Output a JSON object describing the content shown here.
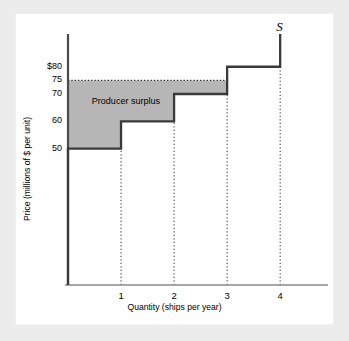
{
  "figure": {
    "background": "#ececec",
    "panel_background": "#ffffff",
    "curve_color": "#3a3a3a",
    "shade_color": "#b6b6b6",
    "axis_color": "#555555"
  },
  "chart_data": {
    "type": "area",
    "title": "",
    "xlabel": "Quantity (ships per year)",
    "ylabel": "Price (millions of $ per unit)",
    "xlim": [
      0,
      4.6
    ],
    "ylim": [
      0,
      92
    ],
    "grid": false,
    "legend": "none",
    "x_ticks": [
      "1",
      "2",
      "3",
      "4"
    ],
    "x_tick_values": [
      1,
      2,
      3,
      4
    ],
    "y_ticks": [
      "$80",
      "75",
      "70",
      "60",
      "50"
    ],
    "y_tick_values": [
      80,
      75,
      70,
      60,
      50
    ],
    "series": [
      {
        "name": "S",
        "type": "step",
        "label": "S",
        "steps": [
          {
            "q_start": 0,
            "q_end": 1,
            "price": 50
          },
          {
            "q_start": 1,
            "q_end": 2,
            "price": 60
          },
          {
            "q_start": 2,
            "q_end": 3,
            "price": 70
          },
          {
            "q_start": 3,
            "q_end": 4,
            "price": 80
          }
        ],
        "vertical_at_q": 4,
        "vertical_top_price": 92
      }
    ],
    "market_price": 75,
    "market_price_line": {
      "value": 75,
      "style": "dotted",
      "from_q": 0,
      "to_q": 3
    },
    "dropline_q_values": [
      1,
      2,
      3,
      4
    ],
    "shaded_region": {
      "label": "Producer surplus",
      "top_price": 75,
      "segments": [
        {
          "q_start": 0,
          "q_end": 1,
          "bottom_price": 50
        },
        {
          "q_start": 1,
          "q_end": 2,
          "bottom_price": 60
        },
        {
          "q_start": 2,
          "q_end": 3,
          "bottom_price": 70
        }
      ]
    },
    "annotations": [
      {
        "text": "Producer surplus",
        "q": 0.45,
        "price": 67
      },
      {
        "text": "S",
        "q": 4.0,
        "price": 92
      }
    ]
  }
}
